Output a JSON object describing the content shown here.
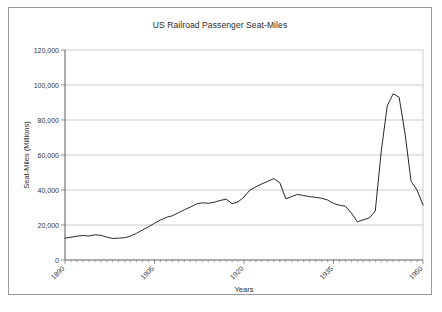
{
  "chart_data": {
    "type": "line",
    "title": "US Railroad Passenger Seat-Miles",
    "xlabel": "Years",
    "ylabel": "Seat-Miles (Millions)",
    "xlim": [
      1890,
      1950
    ],
    "ylim": [
      0,
      120000
    ],
    "grid": true,
    "legend": "none",
    "y_ticks": [
      0,
      20000,
      40000,
      60000,
      80000,
      100000,
      120000
    ],
    "y_tick_labels": [
      "0",
      "20,000",
      "40,000",
      "60,000",
      "80,000",
      "100,000",
      "120,000"
    ],
    "x_ticks": [
      1890,
      1905,
      1920,
      1935,
      1950
    ],
    "x_tick_labels": [
      "1890",
      "1905",
      "1920",
      "1935",
      "1950"
    ],
    "x_minor_tick_step": 1,
    "series": [
      {
        "name": "US Railroad Passenger Seat-Miles",
        "color": "#1a1a1a",
        "x": [
          1890,
          1891,
          1892,
          1893,
          1894,
          1895,
          1896,
          1897,
          1898,
          1899,
          1900,
          1901,
          1902,
          1903,
          1904,
          1905,
          1906,
          1907,
          1908,
          1909,
          1910,
          1911,
          1912,
          1913,
          1914,
          1915,
          1916,
          1917,
          1918,
          1919,
          1920,
          1921,
          1922,
          1923,
          1924,
          1925,
          1926,
          1927,
          1928,
          1929,
          1930,
          1931,
          1932,
          1933,
          1934,
          1935,
          1936,
          1937,
          1938,
          1939,
          1940,
          1941,
          1942,
          1943,
          1944,
          1945,
          1946,
          1947,
          1948,
          1949,
          1950
        ],
        "values": [
          12500,
          13000,
          13600,
          14000,
          13800,
          14300,
          14000,
          13100,
          12400,
          12600,
          12700,
          13600,
          15200,
          17000,
          18800,
          20800,
          22500,
          24200,
          25200,
          26800,
          28500,
          30000,
          31800,
          32600,
          32400,
          32800,
          33800,
          34600,
          32200,
          33000,
          35500,
          39400,
          41400,
          43000,
          44800,
          46500,
          44400,
          35000,
          36200,
          37400,
          36800,
          36200,
          35800,
          35300,
          34400,
          32400,
          31400,
          30800,
          27000,
          22000,
          18200,
          16200,
          16000,
          17200,
          18200,
          20000,
          21400,
          23700,
          21400,
          22400,
          23000
        ]
      }
    ],
    "series_detail_note": "single black line, no markers",
    "peaks": [
      {
        "label": "WWI peak",
        "x": 1925,
        "y": 46500
      },
      {
        "label": "WWII peak",
        "x": 1944,
        "y": 95000
      },
      {
        "label": "Depression trough",
        "x": 1933,
        "y": 16000
      }
    ],
    "wartime_segment": {
      "x": [
        1940,
        1941,
        1942,
        1943,
        1944,
        1945,
        1946,
        1947,
        1948,
        1949,
        1950
      ],
      "values": [
        23000,
        24000,
        28000,
        62000,
        88000,
        95000,
        93000,
        72000,
        45000,
        40000,
        31500
      ]
    },
    "full_x": [
      1890,
      1891,
      1892,
      1893,
      1894,
      1895,
      1896,
      1897,
      1898,
      1899,
      1900,
      1901,
      1902,
      1903,
      1904,
      1905,
      1906,
      1907,
      1908,
      1909,
      1910,
      1911,
      1912,
      1913,
      1914,
      1915,
      1916,
      1917,
      1918,
      1919,
      1920,
      1921,
      1922,
      1923,
      1924,
      1925,
      1926,
      1927,
      1928,
      1929,
      1930,
      1931,
      1932,
      1933,
      1934,
      1935,
      1936,
      1937,
      1938,
      1939,
      1940,
      1941,
      1942,
      1943,
      1944,
      1945,
      1946,
      1947,
      1948,
      1949,
      1950
    ],
    "full_values": [
      12500,
      13000,
      13600,
      14000,
      13700,
      14400,
      14100,
      13100,
      12300,
      12500,
      12700,
      13700,
      15300,
      17200,
      19000,
      21000,
      22800,
      24400,
      25300,
      27000,
      28700,
      30200,
      32000,
      32700,
      32400,
      33000,
      34000,
      34800,
      32200,
      33200,
      36000,
      40000,
      41800,
      43500,
      45000,
      46500,
      44200,
      35000,
      36300,
      37500,
      36800,
      36200,
      35800,
      35300,
      34300,
      32300,
      31300,
      30700,
      26800,
      21800,
      18000,
      16200,
      16000,
      17300,
      18300,
      20100,
      21500,
      24000,
      21500,
      22500,
      23200
    ]
  }
}
